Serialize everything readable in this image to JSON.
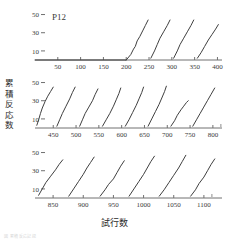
{
  "figure": {
    "subject_label": "P12",
    "y_axis_title": "累積反応数",
    "x_axis_title": "試行数",
    "faint_caption": "図  累積反応記録"
  },
  "chart_data": {
    "type": "line",
    "title": "P12",
    "xlabel": "試行数",
    "ylabel": "累積反応数",
    "ylim": [
      0,
      55
    ],
    "yticks": [
      10,
      30,
      50
    ],
    "grid": false,
    "legend": "none",
    "line_color": "#3f3f3f",
    "axis_color": "#707070",
    "block_size": 50,
    "rows": [
      {
        "row_index": 1,
        "xlim": [
          0,
          410
        ],
        "xticks": [
          50,
          100,
          150,
          200,
          250,
          300,
          350,
          400
        ],
        "series": [
          {
            "name": "0-200",
            "x": [
              0,
              200
            ],
            "values": [
              0,
              0
            ]
          },
          {
            "name": "200-250",
            "x": [
              200,
              210,
              216,
              220,
              224,
              230,
              236,
              242,
              248
            ],
            "values": [
              0,
              6,
              12,
              15,
              21,
              26,
              32,
              38,
              44
            ]
          },
          {
            "name": "250-300",
            "x": [
              254,
              262,
              268,
              274,
              282,
              290,
              296
            ],
            "values": [
              2,
              10,
              17,
              24,
              31,
              38,
              44
            ]
          },
          {
            "name": "300-350",
            "x": [
              304,
              312,
              318,
              326,
              334,
              342,
              348
            ],
            "values": [
              2,
              10,
              17,
              24,
              31,
              38,
              44
            ]
          },
          {
            "name": "350-400",
            "x": [
              356,
              364,
              372,
              380,
              388,
              396,
              402
            ],
            "values": [
              2,
              8,
              15,
              22,
              28,
              34,
              39
            ]
          }
        ]
      },
      {
        "row_index": 2,
        "xlim": [
          410,
          820
        ],
        "xticks": [
          450,
          500,
          550,
          600,
          650,
          700,
          750,
          800
        ],
        "series": [
          {
            "name": "400-450",
            "x": [
              414,
              418,
              422,
              426,
              432,
              438,
              444,
              450
            ],
            "values": [
              3,
              9,
              16,
              22,
              29,
              35,
              40,
              45
            ]
          },
          {
            "name": "450-500",
            "x": [
              458,
              464,
              470,
              478,
              486,
              492,
              498
            ],
            "values": [
              2,
              9,
              16,
              24,
              32,
              39,
              45
            ]
          },
          {
            "name": "500-550",
            "x": [
              508,
              514,
              520,
              528,
              536,
              542,
              548
            ],
            "values": [
              2,
              9,
              16,
              23,
              30,
              37,
              43
            ]
          },
          {
            "name": "550-600",
            "x": [
              558,
              566,
              574,
              582,
              588,
              594,
              598
            ],
            "values": [
              2,
              9,
              16,
              24,
              31,
              38,
              44
            ]
          },
          {
            "name": "600-650",
            "x": [
              608,
              616,
              624,
              632,
              638,
              644,
              648
            ],
            "values": [
              2,
              9,
              17,
              25,
              32,
              39,
              45
            ]
          },
          {
            "name": "650-700",
            "x": [
              658,
              666,
              674,
              682,
              688,
              694,
              698
            ],
            "values": [
              2,
              10,
              18,
              26,
              33,
              40,
              46
            ]
          },
          {
            "name": "700-750",
            "x": [
              708,
              716,
              722,
              730,
              736,
              742,
              746
            ],
            "values": [
              2,
              8,
              14,
              20,
              24,
              28,
              30
            ]
          },
          {
            "name": "750-800",
            "x": [
              756,
              764,
              772,
              780,
              788,
              796,
              804
            ],
            "values": [
              2,
              9,
              16,
              23,
              30,
              37,
              44
            ]
          }
        ]
      },
      {
        "row_index": 3,
        "xlim": [
          820,
          1130
        ],
        "xticks": [
          850,
          900,
          950,
          1000,
          1050,
          1100
        ],
        "series": [
          {
            "name": "820-870",
            "x": [
              826,
              832,
              838,
              846,
              854,
              860,
              866
            ],
            "values": [
              3,
              10,
              17,
              24,
              31,
              37,
              42
            ]
          },
          {
            "name": "870-920",
            "x": [
              876,
              884,
              892,
              900,
              906,
              912,
              918
            ],
            "values": [
              2,
              10,
              18,
              26,
              33,
              39,
              45
            ]
          },
          {
            "name": "920-970",
            "x": [
              928,
              936,
              942,
              950,
              956,
              962,
              968
            ],
            "values": [
              2,
              9,
              15,
              21,
              28,
              35,
              41
            ]
          },
          {
            "name": "970-1020",
            "x": [
              976,
              984,
              992,
              1000,
              1006,
              1012,
              1018
            ],
            "values": [
              2,
              10,
              18,
              26,
              33,
              40,
              46
            ]
          },
          {
            "name": "1020-1070",
            "x": [
              1026,
              1034,
              1042,
              1050,
              1058,
              1064,
              1070
            ],
            "values": [
              2,
              9,
              17,
              25,
              33,
              40,
              47
            ]
          },
          {
            "name": "1070-1120",
            "x": [
              1078,
              1086,
              1092,
              1100,
              1106,
              1112,
              1118
            ],
            "values": [
              2,
              9,
              16,
              23,
              30,
              37,
              43
            ]
          }
        ]
      }
    ]
  }
}
